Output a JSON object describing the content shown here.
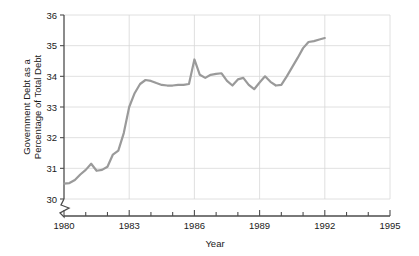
{
  "chart_data": {
    "type": "line",
    "title": "",
    "xlabel": "Year",
    "ylabel": "Government Debt as a Percentage of Total Debt",
    "ylabel_line1": "Government Debt as a",
    "ylabel_line2": "Percentage of Total Debt",
    "xlim": [
      1980,
      1995
    ],
    "ylim": [
      30,
      36
    ],
    "y_axis_broken": true,
    "y_axis_break_note": "zigzag break below 30",
    "grid": true,
    "grid_x": true,
    "grid_y": true,
    "legend": "none",
    "xticks": [
      1980,
      1983,
      1986,
      1989,
      1992,
      1995
    ],
    "xtick_labels": [
      "1980",
      "1983",
      "1986",
      "1989",
      "1992",
      "1995"
    ],
    "x_minor_tick_interval": 1,
    "yticks": [
      30,
      31,
      32,
      33,
      34,
      35,
      36
    ],
    "ytick_labels": [
      "30",
      "31",
      "32",
      "33",
      "34",
      "35",
      "36"
    ],
    "line_color": "#9a9a9a",
    "line_width": 2.2,
    "grid_color": "#d8d8d8",
    "axis_color": "#4d4d4d",
    "text_color": "#1a1a1a",
    "background": "#ffffff",
    "series": [
      {
        "name": "Government Debt as a Percentage of Total Debt",
        "x": [
          1980.0,
          1980.25,
          1980.5,
          1980.75,
          1981.0,
          1981.25,
          1981.5,
          1981.75,
          1982.0,
          1982.25,
          1982.5,
          1982.75,
          1983.0,
          1983.25,
          1983.5,
          1983.75,
          1984.0,
          1984.25,
          1984.5,
          1984.75,
          1985.0,
          1985.25,
          1985.5,
          1985.75,
          1986.0,
          1986.25,
          1986.5,
          1986.75,
          1987.0,
          1987.25,
          1987.5,
          1987.75,
          1988.0,
          1988.25,
          1988.5,
          1988.75,
          1989.0,
          1989.25,
          1989.5,
          1989.75,
          1990.0,
          1990.25,
          1990.5,
          1990.75,
          1991.0,
          1991.25,
          1991.5,
          1991.75,
          1992.0
        ],
        "values": [
          30.5,
          30.52,
          30.62,
          30.8,
          30.95,
          31.15,
          30.92,
          30.95,
          31.05,
          31.45,
          31.58,
          32.15,
          33.0,
          33.45,
          33.75,
          33.88,
          33.85,
          33.78,
          33.72,
          33.7,
          33.7,
          33.72,
          33.72,
          33.75,
          34.55,
          34.05,
          33.95,
          34.05,
          34.08,
          34.1,
          33.85,
          33.7,
          33.9,
          33.95,
          33.72,
          33.58,
          33.8,
          34.0,
          33.82,
          33.7,
          33.72,
          34.0,
          34.3,
          34.6,
          34.92,
          35.12,
          35.15,
          35.2,
          35.25
        ]
      }
    ],
    "annotations": [
      {
        "name": "axis-break",
        "axis": "y",
        "below_value": 30,
        "shape": "zigzag"
      }
    ]
  }
}
